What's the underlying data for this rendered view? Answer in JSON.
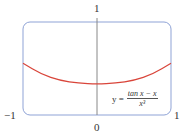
{
  "chart_data": {
    "type": "line",
    "title": "",
    "xlabel": "",
    "ylabel": "",
    "xlim": [
      -1,
      1
    ],
    "ylim": [
      0,
      1
    ],
    "x_tick_labels": [
      "-1",
      "0",
      "1"
    ],
    "y_tick_labels": [
      "1"
    ],
    "grid": false,
    "annotation": {
      "lhs": "y =",
      "numerator": "tan x − x",
      "denominator": "x³"
    },
    "series": [
      {
        "name": "y = (tan x − x)/x³",
        "color": "#d9453a",
        "x": [
          -1,
          -0.75,
          -0.5,
          -0.25,
          0,
          0.25,
          0.5,
          0.75,
          1
        ],
        "values": [
          0.557,
          0.438,
          0.371,
          0.342,
          0.333,
          0.342,
          0.371,
          0.438,
          0.557
        ]
      }
    ],
    "frame_color": "#8fa3d6"
  },
  "labels": {
    "x_min": "−1",
    "x_zero": "0",
    "x_max": "1",
    "y_max": "1",
    "eq_lhs": "y =",
    "eq_num": "tan x − x",
    "eq_den": "x³"
  }
}
